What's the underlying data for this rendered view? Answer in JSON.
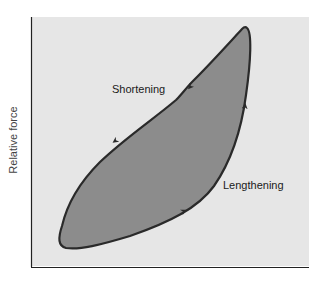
{
  "diagram": {
    "type": "force-length hysteresis loop",
    "y_axis_label": "Relative force",
    "x_axis_label": "",
    "loop_labels": {
      "upper_branch": "Shortening",
      "lower_branch": "Lengthening"
    },
    "direction": "counterclockwise: force rises during lengthening (lower/right branch, arrows up-right), falls during shortening (upper/left branch, arrows down-left)",
    "colors": {
      "plot_background": "#e6e6e6",
      "loop_fill": "#8c8c8c",
      "loop_stroke": "#2a2a2a",
      "axis": "#222222"
    }
  }
}
